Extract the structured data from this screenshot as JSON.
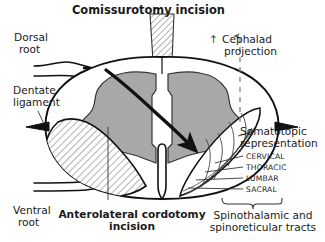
{
  "figure": {
    "kind": "anatomical-diagram",
    "background_color": "#ffffff",
    "ink_color": "#1a1a1a",
    "gray_matter_color": "#a8a8a8",
    "hatch_color": "#4d4d4d",
    "white_matter_color": "#ffffff"
  },
  "titles": {
    "top": "Comissurotomy incision",
    "bottom_line1": "Anterolateral cordotomy",
    "bottom_line2": "incision"
  },
  "labels": {
    "dorsal_root_line1": "Dorsal",
    "dorsal_root_line2": "root",
    "dentate_ligament_line1": "Dentate",
    "dentate_ligament_line2": "ligament",
    "ventral_root_line1": "Ventral",
    "ventral_root_line2": "root",
    "cephalad_line1": "Cephalad",
    "cephalad_line2": "projection",
    "cephalad_arrow": "↑",
    "somatotopic_line1": "Somatotopic",
    "somatotopic_line2": "representation",
    "tracts_line1": "Spinothalamic and",
    "tracts_line2": "spinoreticular tracts"
  },
  "somatotopic_layers": [
    {
      "name": "CERVICAL"
    },
    {
      "name": "THORACIC"
    },
    {
      "name": "LUMBAR"
    },
    {
      "name": "SACRAL"
    }
  ]
}
